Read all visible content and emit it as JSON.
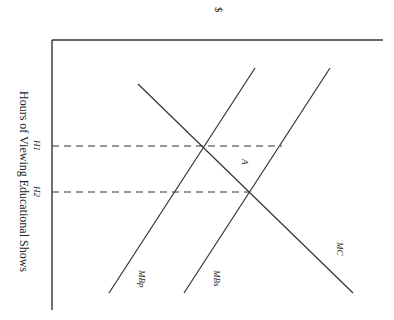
{
  "diagram": {
    "orientation": "rotated 90 degrees clockwise",
    "y_axis_label": "$",
    "x_axis_label": "Hours of Viewing Educational Shows",
    "tick_labels": {
      "h1": "H1",
      "h2": "H2"
    },
    "curve_labels": {
      "mc": "MC",
      "mbs": "MBs",
      "mbp": "MBp"
    },
    "area_label": "A",
    "colors": {
      "line": "#333333",
      "background": "#ffffff"
    }
  }
}
